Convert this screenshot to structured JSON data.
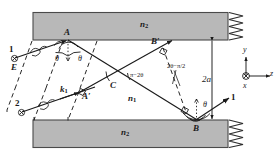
{
  "figure": {
    "kind": "optical-waveguide-ray-diagram",
    "colors": {
      "cladding_fill": "#b8b8b8",
      "cladding_stroke": "#4a4a4a",
      "ray_stroke": "#1a1a1a",
      "dashed_stroke": "#1a1a1a",
      "text": "#1a1a1a",
      "background": "#ffffff"
    }
  },
  "media": {
    "top_cladding_label": "n",
    "top_cladding_sub": "2",
    "bottom_cladding_label": "n",
    "bottom_cladding_sub": "2",
    "core_label": "n",
    "core_sub": "1"
  },
  "points": {
    "A": "A",
    "A_prime": "A′",
    "B": "B",
    "B_prime": "B′",
    "C": "C",
    "E": "E"
  },
  "rays": {
    "incoming_top": "1",
    "incoming_bottom": "2",
    "outgoing": "1"
  },
  "vectors": {
    "wavevector": "k",
    "wavevector_sub": "1"
  },
  "angles": {
    "theta_A_left": "θ",
    "theta_A_right": "θ",
    "theta_B": "θ",
    "pi_minus_2theta": "π−2θ",
    "two_theta_minus_half_pi": "2θ−π/2"
  },
  "dimension": {
    "core_thickness": "2a"
  },
  "axes": {
    "y": "y",
    "z": "z",
    "x": "x"
  }
}
